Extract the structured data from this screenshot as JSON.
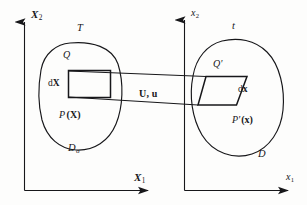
{
  "figure": {
    "background_color": "#fdfdfc",
    "line_color": "#17171a"
  },
  "left_panel": {
    "configuration_label": "T",
    "axis_y_label": "X",
    "axis_y_subscript": "2",
    "axis_x_label": "X",
    "axis_x_subscript": "1",
    "domain_label": "D",
    "domain_subscript": "o",
    "point_label": "P",
    "point_argument": "(X)",
    "corner_label": "Q",
    "element_label": "d",
    "element_vector": "X"
  },
  "right_panel": {
    "configuration_label": "t",
    "axis_y_label": "x",
    "axis_y_subscript": "2",
    "axis_x_label": "x",
    "axis_x_subscript": "1",
    "domain_label": "D",
    "point_label": "P",
    "point_prime": "'",
    "point_argument": "(x)",
    "corner_label": "Q",
    "corner_prime": "'",
    "element_label": "d",
    "element_vector": "x"
  },
  "mapping": {
    "displacement_label": "U, u"
  }
}
